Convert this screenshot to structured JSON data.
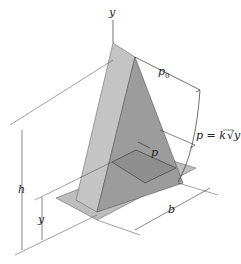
{
  "figure": {
    "type": "engineering-mechanics-diagram",
    "labels": {
      "y_axis": "y",
      "p0": "p",
      "p0_sub": "0",
      "pressure_eq_lhs": "p = k",
      "pressure_eq_rad": "y",
      "p_inner": "p",
      "h": "h",
      "y_dim": "y",
      "b": "b"
    },
    "colors": {
      "plate": "#b9b9b9",
      "face_light": "#c2c2c2",
      "face_dark": "#9a9a9a",
      "slice": "#8e8e8e",
      "line": "#333333"
    }
  }
}
